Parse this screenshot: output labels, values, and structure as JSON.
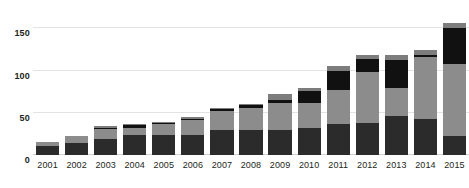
{
  "chart_data": {
    "type": "bar",
    "title": "",
    "subtitle": "",
    "xlabel": "",
    "ylabel": "",
    "stacked": true,
    "grid": true,
    "legend": "none",
    "ylim": [
      0,
      160
    ],
    "yticks": [
      0,
      50,
      100,
      150
    ],
    "ytick_labels": [
      "0",
      "50",
      "100",
      "150"
    ],
    "categories": [
      "2001",
      "2002",
      "2003",
      "2004",
      "2005",
      "2006",
      "2007",
      "2008",
      "2009",
      "2010",
      "2011",
      "2012",
      "2013",
      "2014",
      "2015"
    ],
    "series": [
      {
        "name": "segment-1-dark",
        "color": "#2b2b2b",
        "values": [
          11,
          14,
          19,
          24,
          24,
          24,
          30,
          30,
          30,
          32,
          37,
          38,
          46,
          43,
          22
        ]
      },
      {
        "name": "segment-2-gray",
        "color": "#8c8c8c",
        "values": [
          4,
          8,
          12,
          8,
          13,
          17,
          22,
          26,
          32,
          30,
          40,
          60,
          33,
          73,
          86
        ]
      },
      {
        "name": "segment-3-black",
        "color": "#111111",
        "values": [
          0,
          0,
          1,
          3,
          1,
          2,
          2,
          3,
          3,
          14,
          22,
          16,
          34,
          3,
          42
        ]
      },
      {
        "name": "segment-4-gray-top",
        "color": "#7d7d7d",
        "values": [
          0,
          0,
          2,
          2,
          1,
          2,
          2,
          2,
          7,
          3,
          6,
          4,
          6,
          6,
          7
        ]
      }
    ],
    "totals": [
      15,
      22,
      34,
      37,
      39,
      45,
      56,
      61,
      72,
      79,
      105,
      118,
      119,
      125,
      157
    ],
    "colors": {
      "gridline": "#e3e3e3",
      "baseline": "#cfcfcf",
      "text": "#231f20",
      "background": "#ffffff"
    }
  }
}
